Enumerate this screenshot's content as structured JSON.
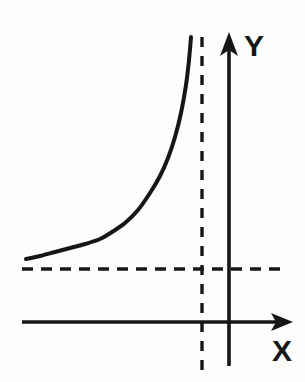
{
  "figure": {
    "background_color": "#fdfdfb",
    "ink_color": "#161616"
  },
  "axes": {
    "x_axis": {
      "label": "X",
      "name": "x-axis",
      "style": "solid",
      "arrow": "right",
      "y_pixel": 322,
      "x_start_pixel": 22,
      "x_end_pixel": 293
    },
    "y_axis": {
      "label": "Y",
      "name": "y-axis",
      "style": "solid",
      "arrow": "up",
      "x_pixel": 229,
      "y_start_pixel": 33,
      "y_end_pixel": 366
    }
  },
  "asymptotes": [
    {
      "name": "vertical-asymptote",
      "orientation": "vertical",
      "style": "dashed",
      "x_pixel": 202,
      "y_start_pixel": 37,
      "y_end_pixel": 373
    },
    {
      "name": "horizontal-asymptote",
      "orientation": "horizontal",
      "style": "dashed",
      "y_pixel": 269,
      "x_start_pixel": 22,
      "x_end_pixel": 286
    }
  ],
  "chart_data": {
    "type": "line",
    "title": "",
    "xlabel": "X",
    "ylabel": "Y",
    "legend": [],
    "grid": false,
    "annotations": [
      "vertical dashed asymptote left of the Y axis",
      "horizontal dashed asymptote below the curve"
    ],
    "series": [
      {
        "name": "curve",
        "description": "Monotonically increasing convex curve approaching a vertical asymptote",
        "stroke_width": 4,
        "color": "#161616",
        "points_pixel": [
          [
            26,
            259
          ],
          [
            40,
            256
          ],
          [
            55,
            252
          ],
          [
            70,
            248
          ],
          [
            85,
            244
          ],
          [
            100,
            239
          ],
          [
            112,
            232
          ],
          [
            125,
            223
          ],
          [
            138,
            210
          ],
          [
            150,
            193
          ],
          [
            160,
            176
          ],
          [
            168,
            158
          ],
          [
            175,
            137
          ],
          [
            181,
            113
          ],
          [
            186,
            85
          ],
          [
            189,
            60
          ],
          [
            191,
            37
          ]
        ]
      }
    ],
    "xlim_pixel": [
      22,
      293
    ],
    "ylim_pixel": [
      37,
      322
    ]
  },
  "labels": {
    "y_label": "Y",
    "x_label": "X"
  }
}
